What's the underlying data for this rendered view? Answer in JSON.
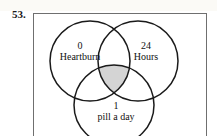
{
  "problem": {
    "number": "53."
  },
  "figure": {
    "type": "venn-diagram-three-set",
    "shading": {
      "region": "triple-intersection",
      "fill_color": "#d4d4d4",
      "stroke_color": "#1a1a1a"
    },
    "frame_color": "#6f6f6f",
    "background_color": "#ffffff",
    "circles": [
      {
        "id": "left",
        "count": "0",
        "word": "Heartburn",
        "cx": 57,
        "cy": 48,
        "r": 40
      },
      {
        "id": "right",
        "count": "24",
        "word": "Hours",
        "cx": 105,
        "cy": 48,
        "r": 40
      },
      {
        "id": "bottom",
        "count": "1",
        "word": "pill a day",
        "cx": 81,
        "cy": 92,
        "r": 40
      }
    ]
  }
}
